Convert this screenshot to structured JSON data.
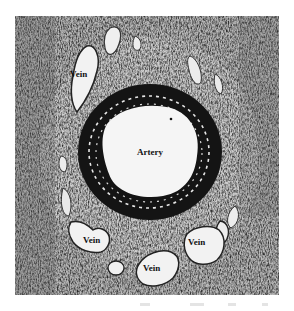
{
  "figure": {
    "labels": {
      "artery": "Artery",
      "vein_upper_left": "Vein",
      "vein_lower_left": "Vein",
      "vein_lower_middle": "Vein",
      "vein_lower_right": "Vein"
    },
    "colors": {
      "tissue_mid": "#b9b9b9",
      "tissue_dark": "#3a3a3a",
      "artery_wall": "#111111",
      "lumen": "#f4f4f4",
      "background": "#ffffff"
    }
  }
}
